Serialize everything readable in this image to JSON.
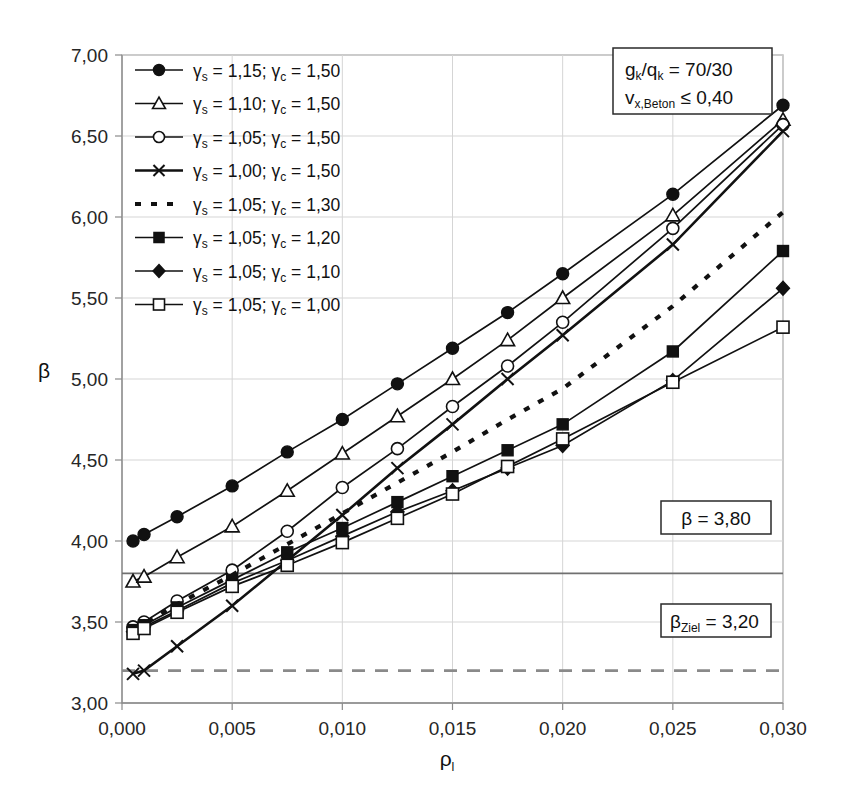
{
  "chart_data": {
    "type": "line",
    "title": "",
    "xlabel": "ρl",
    "ylabel": "β",
    "xlim": [
      0.0,
      0.03
    ],
    "ylim": [
      3.0,
      7.0
    ],
    "grid": true,
    "legend_position": "top-left",
    "x_ticks": [
      "0,000",
      "0,005",
      "0,010",
      "0,015",
      "0,020",
      "0,025",
      "0,030"
    ],
    "x_tick_values": [
      0.0,
      0.005,
      0.01,
      0.015,
      0.02,
      0.025,
      0.03
    ],
    "y_ticks": [
      "3,00",
      "3,50",
      "4,00",
      "4,50",
      "5,00",
      "5,50",
      "6,00",
      "6,50",
      "7,00"
    ],
    "y_tick_values": [
      3.0,
      3.5,
      4.0,
      4.5,
      5.0,
      5.5,
      6.0,
      6.5,
      7.0
    ],
    "x": [
      0.0005,
      0.001,
      0.0025,
      0.005,
      0.0075,
      0.01,
      0.0125,
      0.015,
      0.0175,
      0.02,
      0.025,
      0.03
    ],
    "series": [
      {
        "name": "γs = 1,15; γc = 1,50",
        "marker": "circle-filled",
        "style": "solid",
        "values": [
          4.0,
          4.04,
          4.15,
          4.34,
          4.55,
          4.75,
          4.97,
          5.19,
          5.41,
          5.65,
          6.14,
          6.69
        ]
      },
      {
        "name": "γs = 1,10; γc = 1,50",
        "marker": "triangle-open",
        "style": "solid",
        "values": [
          3.75,
          3.78,
          3.9,
          4.09,
          4.31,
          4.54,
          4.77,
          5.0,
          5.24,
          5.5,
          6.01,
          6.6
        ]
      },
      {
        "name": "γs = 1,05; γc = 1,50",
        "marker": "circle-open",
        "style": "solid",
        "values": [
          3.47,
          3.5,
          3.63,
          3.82,
          4.06,
          4.33,
          4.57,
          4.83,
          5.08,
          5.35,
          5.93,
          6.57
        ]
      },
      {
        "name": "γs = 1,00; γc = 1,50",
        "marker": "cross",
        "style": "solid-thick",
        "values": [
          3.18,
          3.2,
          3.35,
          3.6,
          3.88,
          4.16,
          4.45,
          4.72,
          5.0,
          5.27,
          5.83,
          6.53
        ]
      },
      {
        "name": "γs = 1,05; γc = 1,30",
        "marker": "none",
        "style": "dotted",
        "values": [
          3.46,
          3.49,
          3.61,
          3.79,
          3.98,
          4.17,
          4.36,
          4.55,
          4.75,
          4.94,
          5.45,
          6.03
        ]
      },
      {
        "name": "γs = 1,05; γc = 1,20",
        "marker": "square-filled",
        "style": "solid",
        "values": [
          3.45,
          3.48,
          3.59,
          3.76,
          3.93,
          4.08,
          4.24,
          4.4,
          4.56,
          4.72,
          5.17,
          5.79
        ]
      },
      {
        "name": "γs = 1,05; γc = 1,10",
        "marker": "diamond-filled",
        "style": "solid",
        "values": [
          3.44,
          3.47,
          3.57,
          3.74,
          3.88,
          4.03,
          4.18,
          4.31,
          4.45,
          4.59,
          4.99,
          5.56
        ]
      },
      {
        "name": "γs = 1,05; γc = 1,00",
        "marker": "square-open",
        "style": "solid",
        "values": [
          3.43,
          3.46,
          3.56,
          3.72,
          3.85,
          3.99,
          4.14,
          4.29,
          4.46,
          4.63,
          4.98,
          5.32
        ]
      }
    ],
    "reference_lines": [
      {
        "label": "β = 3,80",
        "value": 3.8,
        "style": "solid"
      },
      {
        "label": "βZiel = 3,20",
        "value": 3.2,
        "style": "dashed"
      }
    ],
    "annotations": [
      {
        "line1": "gk/qk = 70/30",
        "line2": "vx,Beton ≤ 0,40"
      }
    ]
  },
  "axes": {
    "y_title": "β",
    "x_title_base": "ρ",
    "x_title_sub": "l"
  },
  "legend": {
    "entries": [
      {
        "gamma_s": "1,15",
        "gamma_c": "1,50",
        "marker": "circle-filled",
        "style": "solid"
      },
      {
        "gamma_s": "1,10",
        "gamma_c": "1,50",
        "marker": "triangle-open",
        "style": "solid"
      },
      {
        "gamma_s": "1,05",
        "gamma_c": "1,50",
        "marker": "circle-open",
        "style": "solid"
      },
      {
        "gamma_s": "1,00",
        "gamma_c": "1,50",
        "marker": "cross",
        "style": "solid-thick"
      },
      {
        "gamma_s": "1,05",
        "gamma_c": "1,30",
        "marker": "none",
        "style": "dotted"
      },
      {
        "gamma_s": "1,05",
        "gamma_c": "1,20",
        "marker": "square-filled",
        "style": "solid"
      },
      {
        "gamma_s": "1,05",
        "gamma_c": "1,10",
        "marker": "diamond-filled",
        "style": "solid"
      },
      {
        "gamma_s": "1,05",
        "gamma_c": "1,00",
        "marker": "square-open",
        "style": "solid"
      }
    ]
  },
  "annotation_boxes": {
    "top_right": {
      "row1_num": "70/30",
      "row2_num": "0,40"
    },
    "beta_box": {
      "text": "β = 3,80"
    },
    "beta_ziel_box": {
      "value": "3,20"
    }
  },
  "colors": {
    "line": "#111111",
    "grid": "#d5d5d5",
    "axis": "#8a8a8a",
    "ref_solid": "#707070",
    "ref_dashed": "#8a8a8a",
    "background": "#ffffff"
  }
}
